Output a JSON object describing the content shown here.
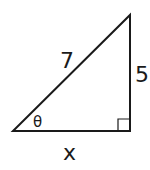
{
  "diagram": {
    "type": "right-triangle",
    "hypotenuse_label": "7",
    "opposite_side_label": "5",
    "adjacent_side_label": "x",
    "angle_label": "θ",
    "right_angle_marker": true,
    "stroke_color": "#1a1a1a"
  }
}
